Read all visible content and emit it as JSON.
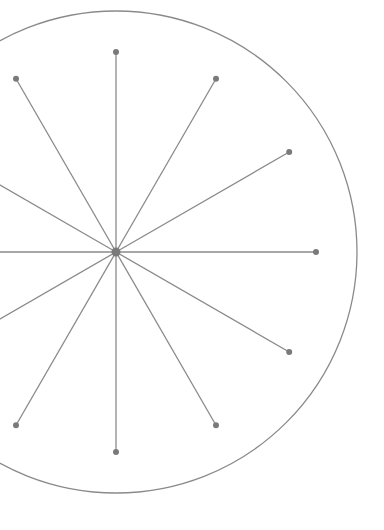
{
  "diagram": {
    "type": "radial-spokes",
    "center": {
      "x": 116,
      "y": 252
    },
    "outer_circle_radius": 241,
    "spoke_length": 200,
    "spoke_count": 12,
    "spoke_angle_step_deg": 30,
    "center_dot_radius": 4.5,
    "endpoint_dot_radius": 3,
    "colors": {
      "background": "#ffffff",
      "circle_stroke": "#8a8a8a",
      "spoke_stroke": "#8a8a8a",
      "dot_fill": "#7a7a7a"
    }
  }
}
